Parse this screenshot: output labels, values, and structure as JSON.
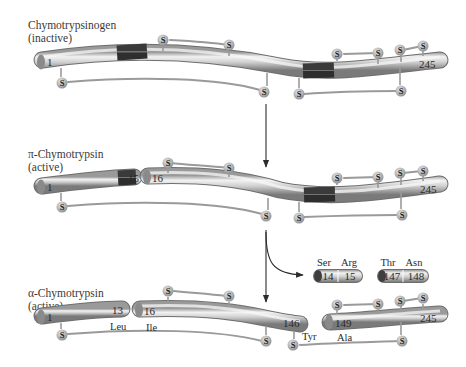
{
  "diagram": {
    "type": "protein-activation-scheme",
    "stages": [
      {
        "name": "chymotrypsinogen",
        "title_line1": "Chymotrypsinogen",
        "title_line2": "(inactive)",
        "segments": [
          {
            "start_label": "1",
            "end_label": "245"
          }
        ]
      },
      {
        "name": "pi-chymotrypsin",
        "title_line1": "π-Chymotrypsin",
        "title_line2": "(active)",
        "segments": [
          {
            "start_label": "1",
            "end_label": "15"
          },
          {
            "start_label": "16",
            "end_label": "245"
          }
        ]
      },
      {
        "name": "alpha-chymotrypsin",
        "title_line1": "α-Chymotrypsin",
        "title_line2": "(active)",
        "segments": [
          {
            "start_label": "1",
            "end_label": "13",
            "residue_below_end": "Leu"
          },
          {
            "start_label": "16",
            "end_label": "146",
            "residue_below_start": "Ile",
            "residue_below_end": "Tyr"
          },
          {
            "start_label": "149",
            "end_label": "245",
            "residue_below_start": "Ala"
          }
        ]
      }
    ],
    "released_dipeptides": [
      {
        "residues": [
          "Ser",
          "Arg"
        ],
        "numbers": [
          "14",
          "15"
        ]
      },
      {
        "residues": [
          "Thr",
          "Asn"
        ],
        "numbers": [
          "147",
          "148"
        ]
      }
    ],
    "disulfide_label": "S",
    "colors": {
      "rod_light": "#e6e6e6",
      "rod_mid": "#b5b5b5",
      "rod_dark": "#7d7d7d",
      "cleavage_band": "#4a4a4a",
      "bridge": "#9a9a9a",
      "text": "#2a2a2a"
    }
  }
}
